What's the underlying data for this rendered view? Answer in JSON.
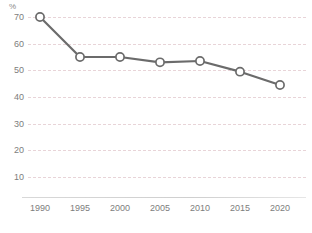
{
  "chart_data": {
    "type": "line",
    "title": "",
    "subtitle": "",
    "xlabel": "",
    "ylabel": "",
    "unit_label": "%",
    "categories": [
      "1990",
      "1995",
      "2000",
      "2005",
      "2010",
      "2015",
      "2020"
    ],
    "values": [
      70,
      55,
      55,
      53,
      53.5,
      49.5,
      44.5
    ],
    "series": [
      {
        "name": "",
        "values": [
          70,
          55,
          55,
          53,
          53.5,
          49.5,
          44.5
        ]
      }
    ],
    "ylim": [
      0,
      75
    ],
    "yticks": [
      10,
      20,
      30,
      40,
      50,
      60,
      70
    ],
    "ytick_labels": [
      "10",
      "20",
      "30",
      "40",
      "50",
      "60",
      "70"
    ],
    "xtick_labels": [
      "1990",
      "1995",
      "2000",
      "2005",
      "2010",
      "2015",
      "2020"
    ],
    "grid": true,
    "grid_style": "dashed-horizontal",
    "legend": "none",
    "marker": "circle-open",
    "colors": {
      "line": "#6b6b6b",
      "marker_fill": "#ffffff",
      "marker_stroke": "#6b6b6b",
      "gridline": "#e8d4d8",
      "tick_text": "#7d7d7d",
      "axis": "#d4d4d4",
      "background": "#ffffff"
    }
  },
  "footer": {
    "source_note": ""
  }
}
